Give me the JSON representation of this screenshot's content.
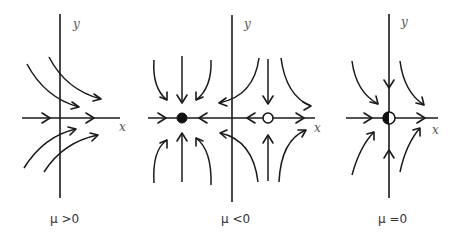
{
  "figure": {
    "panels": [
      {
        "id": "mu-positive",
        "caption": "μ >0",
        "x_label": "x",
        "y_label": "y",
        "fixed_points": [],
        "description": "No fixed points; all trajectories flow rightward"
      },
      {
        "id": "mu-negative",
        "caption": "μ <0",
        "x_label": "x",
        "y_label": "y",
        "fixed_points": [
          {
            "type": "stable node",
            "marker": "filled",
            "side": "left of y-axis"
          },
          {
            "type": "saddle",
            "marker": "open",
            "side": "right of y-axis"
          }
        ],
        "description": "Stable node and saddle point"
      },
      {
        "id": "mu-zero",
        "caption": "μ =0",
        "x_label": "x",
        "y_label": "y",
        "fixed_points": [
          {
            "type": "saddle-node",
            "marker": "half-filled",
            "side": "origin"
          }
        ],
        "description": "Node and saddle merge at origin"
      }
    ]
  }
}
